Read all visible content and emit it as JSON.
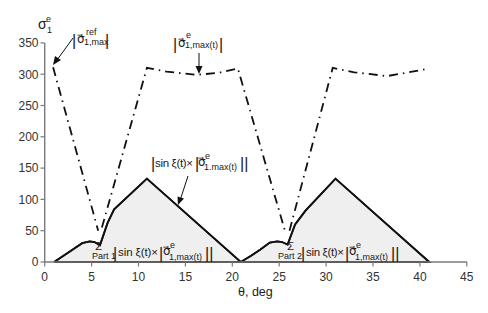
{
  "chart_data": {
    "type": "line",
    "title": "",
    "xlabel": "θ, deg",
    "ylabel": "σe1",
    "xlim": [
      0,
      45
    ],
    "ylim": [
      0,
      350
    ],
    "xticks": [
      0,
      5,
      10,
      15,
      20,
      25,
      30,
      35,
      40,
      45
    ],
    "yticks": [
      0,
      50,
      100,
      150,
      200,
      250,
      300,
      350
    ],
    "grid": false,
    "legend": null,
    "series": [
      {
        "name": "|σ⃗e 1,max(t)| (starting at |σ⃗ref 1,max|)",
        "style": "dash-dot",
        "segments": [
          [
            [
              0.9,
              311
            ],
            [
              5.7,
              50
            ]
          ],
          [
            [
              6.1,
              55
            ],
            [
              10.9,
              310
            ],
            [
              13,
              304
            ],
            [
              16.2,
              299
            ],
            [
              18.5,
              302
            ],
            [
              20.6,
              309
            ],
            [
              25.7,
              45
            ]
          ],
          [
            [
              26.1,
              50
            ],
            [
              30.7,
              310
            ],
            [
              33,
              303
            ],
            [
              36.5,
              297
            ],
            [
              41,
              309
            ]
          ]
        ]
      },
      {
        "name": "Σ |sin ξ(t) × |σ⃗e 1,max(t)||",
        "style": "solid-filled",
        "points": [
          [
            1,
            0
          ],
          [
            2,
            10
          ],
          [
            3,
            20
          ],
          [
            4,
            30
          ],
          [
            4.8,
            33
          ],
          [
            5.3,
            32
          ],
          [
            5.9,
            27
          ],
          [
            6.7,
            62
          ],
          [
            7.4,
            84
          ],
          [
            10.9,
            133
          ],
          [
            20.9,
            0
          ],
          [
            22,
            10
          ],
          [
            23,
            20
          ],
          [
            24,
            31
          ],
          [
            24.8,
            33
          ],
          [
            25.3,
            32
          ],
          [
            25.9,
            28
          ],
          [
            26.7,
            60
          ],
          [
            27.8,
            82
          ],
          [
            31,
            133
          ],
          [
            41,
            0
          ]
        ]
      }
    ],
    "annotations": [
      {
        "text": "|σ⃗ref 1,max|",
        "points_to": [
          0.9,
          311
        ]
      },
      {
        "text": "|σ⃗e 1,max(t)|",
        "points_to": [
          16.5,
          299
        ]
      },
      {
        "text": "|sin ξ(t) × |σ⃗e 1.max(t)||",
        "points_to": [
          14,
          90
        ]
      },
      {
        "text": "Σ Part 1 |sin ξ(t) × |σ⃗e 1,max(t)||",
        "region": "0-21 deg"
      },
      {
        "text": "Σ Part 2 |sin ξ(t) × |σ⃗e 1,max(t)||",
        "region": "21-41 deg"
      }
    ]
  },
  "axes": {
    "ylabel": {
      "base": "σ",
      "sup": "e",
      "sub": "1"
    },
    "xlabel": "θ, deg"
  },
  "labels": {
    "ref": {
      "open": "|",
      "base": "σ⃗",
      "sup": "ref",
      "sub": "1,max",
      "close": "|"
    },
    "max_t": {
      "open": "|",
      "base": "σ⃗",
      "sup": "e",
      "sub": "1,max(t)",
      "close": "|"
    },
    "sin_product": {
      "open": "|",
      "text": "sin ξ(t)×",
      "inner_open": "|",
      "base": "σ⃗",
      "sup": "e",
      "sub": "1.max(t)",
      "close": "||"
    },
    "part1": {
      "sigma": "Σ",
      "part": "Part 1",
      "open": "|",
      "text": "sin ξ(t)×",
      "inner_open": "|",
      "base": "σ⃗",
      "sup": "e",
      "sub": "1,max(t)",
      "close": "||"
    },
    "part2": {
      "sigma": "Σ",
      "part": "Part 2",
      "open": "|",
      "text": "sin ξ(t)×",
      "inner_open": "|",
      "base": "σ⃗",
      "sup": "e",
      "sub": "1,max(t)",
      "close": "||"
    }
  }
}
